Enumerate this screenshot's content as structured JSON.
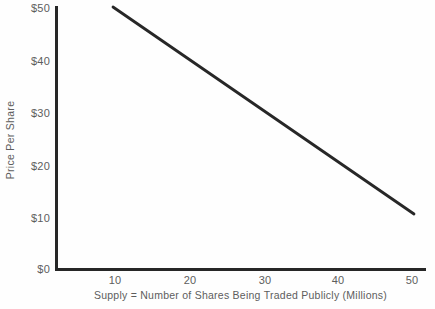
{
  "chart_data": {
    "type": "line",
    "title": "",
    "xlabel": "Supply = Number of Shares Being Traded Publicly (Millions)",
    "ylabel": "Price Per Share",
    "x_tick_labels": [
      "10",
      "20",
      "30",
      "40",
      "50"
    ],
    "x_tick_values": [
      10,
      20,
      30,
      40,
      50
    ],
    "y_tick_labels": [
      "$0",
      "$10",
      "$20",
      "$30",
      "$40",
      "$50"
    ],
    "y_tick_values": [
      0,
      10,
      20,
      30,
      40,
      50
    ],
    "xlim": [
      5,
      55
    ],
    "ylim": [
      0,
      50
    ],
    "grid": false,
    "legend": false,
    "legend_position": "none",
    "series": [
      {
        "name": "Supply curve",
        "x": [
          10,
          50
        ],
        "values": [
          50,
          10.5
        ],
        "color": "#272727",
        "line_width": 2.8
      }
    ],
    "annotations": []
  },
  "axis_colors": {
    "axis_line": "#272727",
    "tick_label": "#5d5d5d",
    "axis_title": "#5d5d5d",
    "background": "#fefefe"
  }
}
